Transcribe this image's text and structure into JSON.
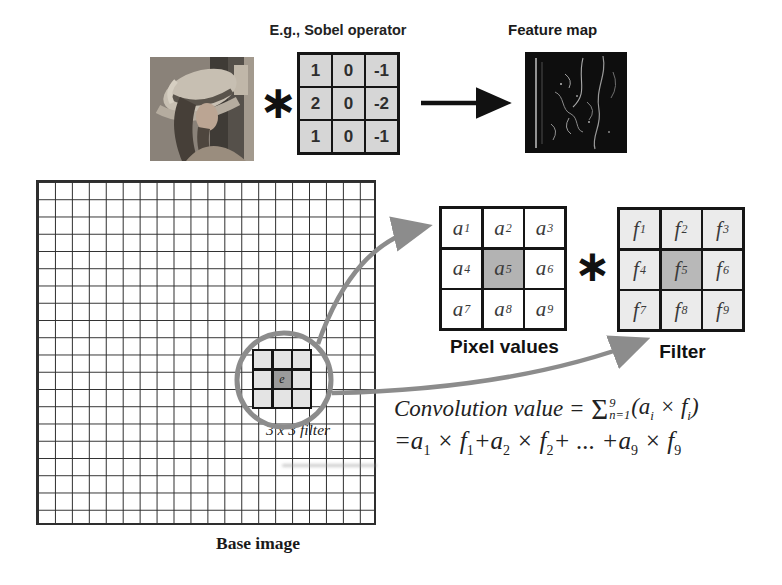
{
  "top": {
    "sobel_title": "E.g., Sobel operator",
    "convolve_symbol": "∗",
    "feature_map_label": "Feature map",
    "sobel_values": [
      "1",
      "0",
      "-1",
      "2",
      "0",
      "-2",
      "1",
      "0",
      "-1"
    ]
  },
  "base": {
    "label": "Base image",
    "filter_area_label": "3 x 3 filter",
    "center_letter": "e"
  },
  "pixel_values": {
    "label": "Pixel values",
    "cells": [
      "a1",
      "a2",
      "a3",
      "a4",
      "a5",
      "a6",
      "a7",
      "a8",
      "a9"
    ],
    "highlight_index": 4
  },
  "filter": {
    "label": "Filter",
    "cells": [
      "f1",
      "f2",
      "f3",
      "f4",
      "f5",
      "f6",
      "f7",
      "f8",
      "f9"
    ],
    "highlight_index": 4
  },
  "mid_convolve_symbol": "∗",
  "formula": {
    "line1_lead": "Convolution value = ",
    "sigma": "Σ",
    "sigma_sup": "9",
    "sigma_sub": "n=1",
    "term_open": "(a",
    "term_sub1": "i",
    "term_mid": " × f",
    "term_sub2": "i",
    "term_close": ")",
    "line2_tokens": [
      [
        "=a",
        "1"
      ],
      [
        " × f",
        "1"
      ],
      [
        "+a",
        "2"
      ],
      [
        " × f",
        "2"
      ],
      [
        "+ ... ",
        ""
      ],
      [
        "+a",
        "9"
      ],
      [
        " × f",
        "9"
      ]
    ]
  },
  "colors": {
    "annotation_gray": "#8c8c8c",
    "highlight_cell_gray": "#b3b3b3",
    "block_cell_light": "#e4e4e4",
    "sobel_cell_gray": "#d6d6d6",
    "grid_line": "#2e2e2e"
  }
}
